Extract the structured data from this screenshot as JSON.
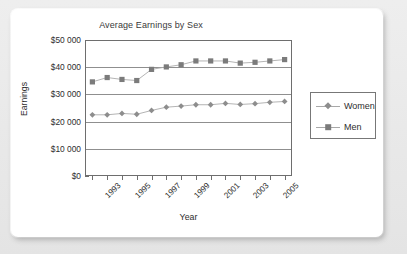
{
  "chart_data": {
    "type": "line",
    "title": "Average Earnings by Sex",
    "xlabel": "Year",
    "ylabel": "Earnings",
    "x": [
      1993,
      1994,
      1995,
      1996,
      1997,
      1998,
      1999,
      2000,
      2001,
      2002,
      2003,
      2004,
      2005,
      2006
    ],
    "categories": [
      "1993",
      "1994",
      "1995",
      "1996",
      "1997",
      "1998",
      "1999",
      "2000",
      "2001",
      "2002",
      "2003",
      "2004",
      "2005",
      "2006"
    ],
    "xtick_labels": [
      "1993",
      "1995",
      "1997",
      "1999",
      "2001",
      "2003",
      "2005"
    ],
    "xtick_years": [
      1993,
      1995,
      1997,
      1999,
      2001,
      2003,
      2005
    ],
    "ytick_labels": [
      "$0",
      "$10 000",
      "$20 000",
      "$30 000",
      "$40 000",
      "$50 000"
    ],
    "ytick_values": [
      0,
      10000,
      20000,
      30000,
      40000,
      50000
    ],
    "ylim": [
      0,
      50000
    ],
    "grid": "horizontal",
    "legend_position": "right",
    "series": [
      {
        "name": "Women",
        "marker": "diamond",
        "color": "#8d8d8d",
        "values": [
          22500,
          22500,
          23000,
          22700,
          24100,
          25300,
          25700,
          26200,
          26200,
          26700,
          26300,
          26600,
          27100,
          27400
        ]
      },
      {
        "name": "Men",
        "marker": "square",
        "color": "#7b7b7b",
        "values": [
          34600,
          36200,
          35500,
          35100,
          39200,
          40100,
          40900,
          42300,
          42300,
          42300,
          41500,
          41800,
          42300,
          42800
        ]
      }
    ]
  },
  "legend": {
    "items": [
      {
        "label": "Women",
        "marker": "diamond"
      },
      {
        "label": "Men",
        "marker": "square"
      }
    ]
  }
}
